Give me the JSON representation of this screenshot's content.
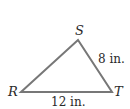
{
  "diagram": {
    "type": "triangle",
    "stroke_color": "#777777",
    "text_color": "#2a2a2a",
    "vertices": {
      "R": {
        "label": "R",
        "x": 21,
        "y": 92
      },
      "S": {
        "label": "S",
        "x": 78,
        "y": 40
      },
      "T": {
        "label": "T",
        "x": 112,
        "y": 92
      }
    },
    "sides": {
      "ST": {
        "label": "8 in."
      },
      "RT": {
        "label": "12 in."
      }
    }
  }
}
